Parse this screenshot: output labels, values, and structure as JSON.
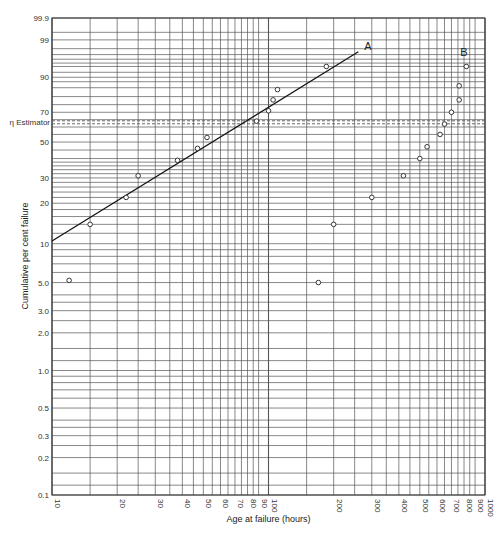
{
  "chart_data": {
    "type": "scatter",
    "title": "",
    "xlabel": "Age at failure (hours)",
    "ylabel": "Cumulative per cent failure",
    "x_scale": "log",
    "y_scale": "weibull",
    "xlim": [
      10,
      1000
    ],
    "ylim": [
      0.1,
      99.9
    ],
    "grid": true,
    "x_ticks": [
      "10",
      "20",
      "30",
      "40",
      "50",
      "60",
      "70",
      "80",
      "90",
      "100",
      "200",
      "300",
      "400",
      "500",
      "600",
      "700",
      "800",
      "900",
      "1000"
    ],
    "y_ticks": [
      "99.9",
      "99",
      "90",
      "70",
      "50",
      "30",
      "20",
      "10",
      "5.0",
      "3.0",
      "2.0",
      "1.0",
      "0.5",
      "0.3",
      "0.2",
      "0.1"
    ],
    "reference_line": {
      "label": "η Estimator",
      "y": 63.2,
      "style": "dashed"
    },
    "series": [
      {
        "name": "A",
        "points": [
          {
            "x": 15,
            "y": 14
          },
          {
            "x": 22,
            "y": 22
          },
          {
            "x": 25,
            "y": 31
          },
          {
            "x": 38,
            "y": 39
          },
          {
            "x": 47,
            "y": 46
          },
          {
            "x": 52,
            "y": 53
          },
          {
            "x": 88,
            "y": 64
          },
          {
            "x": 100,
            "y": 71
          },
          {
            "x": 105,
            "y": 78
          },
          {
            "x": 110,
            "y": 84
          },
          {
            "x": 185,
            "y": 94
          }
        ],
        "fit_line": {
          "from": {
            "x": 10,
            "y": 10.5
          },
          "to": {
            "x": 260,
            "y": 97.5
          }
        }
      },
      {
        "name": "B",
        "points": [
          {
            "x": 12,
            "y": 5.2
          },
          {
            "x": 170,
            "y": 5.0
          },
          {
            "x": 200,
            "y": 14
          },
          {
            "x": 300,
            "y": 22
          },
          {
            "x": 420,
            "y": 31
          },
          {
            "x": 500,
            "y": 40
          },
          {
            "x": 540,
            "y": 47
          },
          {
            "x": 620,
            "y": 55
          },
          {
            "x": 650,
            "y": 62
          },
          {
            "x": 700,
            "y": 70
          },
          {
            "x": 760,
            "y": 78
          },
          {
            "x": 760,
            "y": 86
          },
          {
            "x": 820,
            "y": 94
          }
        ]
      }
    ]
  },
  "labels": {
    "series_a": "A",
    "series_b": "B",
    "eta": "η Estimator",
    "xlabel": "Age at failure (hours)",
    "ylabel": "Cumulative per cent failure"
  }
}
